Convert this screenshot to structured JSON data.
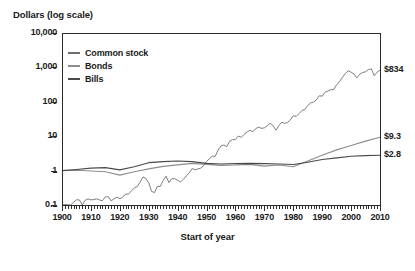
{
  "chart_data": {
    "type": "line",
    "title": "Dollars (log scale)",
    "xlabel": "Start of year",
    "ylabel": "Dollars (log scale)",
    "log_y": true,
    "grid": false,
    "legend_position": "top-left inside plot",
    "xlim": [
      1900,
      2010
    ],
    "ylim": [
      0.1,
      10000
    ],
    "ytick_labels": [
      "10,000",
      "1,000",
      "100",
      "10",
      "1",
      "0.1"
    ],
    "ytick_values": [
      10000,
      1000,
      100,
      10,
      1,
      0.1
    ],
    "xtick_labels": [
      "1900",
      "1910",
      "1920",
      "1930",
      "1940",
      "1950",
      "1960",
      "1970",
      "1980",
      "1990",
      "2000",
      "2010"
    ],
    "xtick_values": [
      1900,
      1910,
      1920,
      1930,
      1940,
      1950,
      1960,
      1970,
      1980,
      1990,
      2000,
      2010
    ],
    "minor_xtick_interval": 1,
    "end_labels": [
      {
        "series": "Common stock",
        "text": "$834",
        "value": 834
      },
      {
        "series": "Bonds",
        "text": "$9.3",
        "value": 9.3
      },
      {
        "series": "Bills",
        "text": "$2.8",
        "value": 2.8
      }
    ],
    "series": [
      {
        "name": "Common stock",
        "color": "#6e6e6e",
        "x": [
          1900,
          1901,
          1902,
          1903,
          1904,
          1905,
          1906,
          1907,
          1908,
          1909,
          1910,
          1911,
          1912,
          1913,
          1914,
          1915,
          1916,
          1917,
          1918,
          1919,
          1920,
          1921,
          1922,
          1923,
          1924,
          1925,
          1926,
          1927,
          1928,
          1929,
          1930,
          1931,
          1932,
          1933,
          1934,
          1935,
          1936,
          1937,
          1938,
          1939,
          1940,
          1941,
          1942,
          1943,
          1944,
          1945,
          1946,
          1947,
          1948,
          1949,
          1950,
          1951,
          1952,
          1953,
          1954,
          1955,
          1956,
          1957,
          1958,
          1959,
          1960,
          1961,
          1962,
          1963,
          1964,
          1965,
          1966,
          1967,
          1968,
          1969,
          1970,
          1971,
          1972,
          1973,
          1974,
          1975,
          1976,
          1977,
          1978,
          1979,
          1980,
          1981,
          1982,
          1983,
          1984,
          1985,
          1986,
          1987,
          1988,
          1989,
          1990,
          1991,
          1992,
          1993,
          1994,
          1995,
          1996,
          1997,
          1998,
          1999,
          2000,
          2001,
          2002,
          2003,
          2004,
          2005,
          2006,
          2007,
          2008,
          2009,
          2010
        ],
        "values": [
          1.0,
          1.18,
          1.16,
          1.05,
          1.36,
          1.62,
          1.6,
          1.1,
          1.56,
          1.72,
          1.6,
          1.64,
          1.72,
          1.59,
          1.52,
          1.95,
          2.0,
          1.5,
          1.73,
          1.93,
          1.73,
          1.92,
          2.36,
          2.36,
          2.93,
          3.57,
          3.87,
          5.25,
          7.43,
          6.8,
          5.03,
          2.83,
          2.6,
          3.99,
          3.95,
          5.85,
          7.84,
          5.09,
          6.65,
          6.62,
          5.97,
          5.29,
          6.36,
          8.01,
          9.6,
          13.1,
          12.0,
          12.7,
          13.4,
          15.9,
          20.9,
          25.3,
          29.9,
          29.6,
          45.1,
          59.4,
          63.2,
          56.4,
          80.9,
          90.6,
          91.0,
          115.5,
          105.5,
          129.5,
          150.6,
          169.5,
          152.4,
          189.0,
          209.8,
          192.0,
          199.6,
          228.2,
          271.4,
          231.6,
          170.3,
          233.6,
          289.4,
          268.9,
          286.4,
          339.4,
          449.4,
          427.3,
          519.2,
          636.4,
          676.5,
          891.2,
          1057,
          1113,
          1298,
          1709,
          1656,
          2160,
          2325,
          2559,
          2592,
          3565,
          4383,
          5845,
          7514,
          9093,
          8262,
          7281,
          5673,
          7297,
          8092,
          8488,
          9827,
          10364,
          6534,
          8263,
          9500
        ],
        "scaled_values": [
          1.0,
          1.18,
          1.16,
          1.05,
          1.36,
          1.62,
          1.6,
          1.1,
          1.56,
          1.72,
          1.6,
          1.64,
          1.72,
          1.59,
          1.52,
          1.95,
          2.0,
          1.5,
          1.73,
          1.93,
          1.73,
          1.92,
          2.36,
          2.36,
          2.93,
          3.57,
          3.87,
          5.25,
          7.43,
          6.8,
          5.03,
          2.83,
          2.6,
          3.99,
          3.95,
          5.85,
          7.84,
          5.09,
          6.65,
          6.62,
          5.97,
          5.29,
          6.36,
          8.01,
          9.6,
          13.1,
          12.0,
          12.7,
          13.4,
          15.9,
          20.9,
          25.3,
          29.9,
          29.6,
          45.1,
          59.4,
          63.2,
          56.4,
          80.9,
          90.6,
          91.0,
          115.5,
          105.5,
          129.5,
          150.6,
          169.5,
          152.4,
          189.0,
          209.8,
          192.0,
          199.6,
          228.2,
          271.4,
          231.6,
          170.3,
          233.6,
          289.4,
          268.9,
          286.4,
          339.4,
          449.4,
          427.3,
          519.2,
          636.4,
          676.5,
          891.2,
          1057,
          1113,
          1298,
          1709,
          1656,
          2160,
          2325,
          2559,
          2592,
          3565,
          4383,
          5845,
          7514,
          9093,
          8262,
          7281,
          5673,
          7297,
          8092,
          8488,
          9827,
          10364,
          6534,
          8263,
          9500
        ],
        "final_value": 834
      },
      {
        "name": "Bonds",
        "color": "#8d8d8d",
        "x": [
          1900,
          1905,
          1910,
          1915,
          1920,
          1925,
          1930,
          1935,
          1940,
          1945,
          1950,
          1955,
          1960,
          1965,
          1970,
          1975,
          1980,
          1985,
          1990,
          1995,
          2000,
          2005,
          2010
        ],
        "values": [
          1.0,
          1.02,
          0.97,
          0.93,
          0.74,
          0.93,
          1.12,
          1.33,
          1.47,
          1.62,
          1.52,
          1.42,
          1.45,
          1.52,
          1.35,
          1.45,
          1.3,
          1.9,
          2.8,
          4.0,
          5.4,
          7.2,
          9.3
        ],
        "final_value": 9.3
      },
      {
        "name": "Bills",
        "color": "#4a4a4a",
        "x": [
          1900,
          1905,
          1910,
          1915,
          1920,
          1925,
          1930,
          1935,
          1940,
          1945,
          1950,
          1955,
          1960,
          1965,
          1970,
          1975,
          1980,
          1985,
          1990,
          1995,
          2000,
          2005,
          2010
        ],
        "values": [
          1.0,
          1.08,
          1.18,
          1.22,
          1.05,
          1.3,
          1.7,
          1.82,
          1.9,
          1.82,
          1.62,
          1.55,
          1.6,
          1.62,
          1.6,
          1.55,
          1.5,
          1.75,
          2.1,
          2.35,
          2.6,
          2.72,
          2.8
        ],
        "final_value": 2.8
      }
    ]
  },
  "legend": {
    "items": [
      {
        "label": "Common stock",
        "color": "#6e6e6e"
      },
      {
        "label": "Bonds",
        "color": "#8d8d8d"
      },
      {
        "label": "Bills",
        "color": "#4a4a4a"
      }
    ]
  }
}
